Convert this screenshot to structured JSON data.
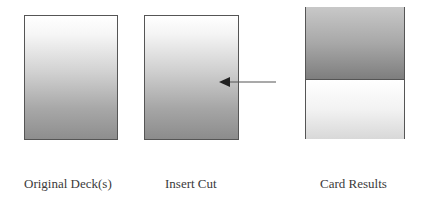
{
  "diagram": {
    "panels": [
      {
        "id": "original-deck",
        "label": "Original Deck(s)"
      },
      {
        "id": "insert-cut",
        "label": "Insert Cut"
      },
      {
        "id": "card-results",
        "label": "Card Results"
      }
    ],
    "arrow": {
      "from": "card-results",
      "to": "insert-cut",
      "direction": "left"
    },
    "colors": {
      "border": "#555555",
      "gradient_light": "#ffffff",
      "gradient_dark": "#8c8c8c",
      "arrow": "#333333"
    }
  }
}
